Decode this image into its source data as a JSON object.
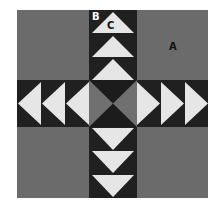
{
  "diagram": {
    "labels": {
      "a": "A",
      "b": "B",
      "c": "C"
    },
    "colors": {
      "background_square": "#6b6b6b",
      "band_dark": "#202020",
      "goose_light": "#e6e6e6",
      "center_gray": "#707070",
      "center_dark": "#1c1c1c",
      "label_dark": "#111111",
      "label_light": "#ffffff"
    },
    "arms": {
      "top": {
        "count": 3,
        "direction": "up"
      },
      "bottom": {
        "count": 3,
        "direction": "down"
      },
      "left": {
        "count": 3,
        "direction": "left"
      },
      "right": {
        "count": 3,
        "direction": "right"
      }
    }
  }
}
